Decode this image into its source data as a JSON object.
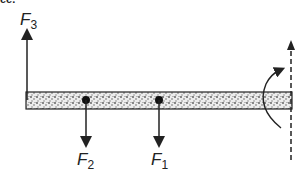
{
  "diagram": {
    "title_fragment": "ee.",
    "beam": {
      "x": 26,
      "y": 92,
      "width": 266,
      "height": 17,
      "fill": "#d8d8d8",
      "stroke": "#222222"
    },
    "forces": [
      {
        "id": "F3",
        "symbol": "F",
        "subscript": "3",
        "direction": "up",
        "x": 27,
        "from_y": 100,
        "to_y": 30,
        "label_x": 20,
        "label_y": 11,
        "applied_dot": false
      },
      {
        "id": "F2",
        "symbol": "F",
        "subscript": "2",
        "direction": "down",
        "x": 86,
        "from_y": 100,
        "to_y": 148,
        "label_x": 77,
        "label_y": 151,
        "applied_dot": true
      },
      {
        "id": "F1",
        "symbol": "F",
        "subscript": "1",
        "direction": "down",
        "x": 159,
        "from_y": 100,
        "to_y": 148,
        "label_x": 151,
        "label_y": 151,
        "applied_dot": true
      }
    ],
    "rotation_axis": {
      "x": 291,
      "from_y": 160,
      "to_y": 40,
      "style": "dashed",
      "arrowhead": "up"
    },
    "rotation_arrow": {
      "description": "curved counter-rotation arrow around axis",
      "direction": "up-right"
    },
    "colors": {
      "ink": "#222222",
      "beam_fill": "#d8d8d8",
      "background": "#ffffff"
    }
  }
}
